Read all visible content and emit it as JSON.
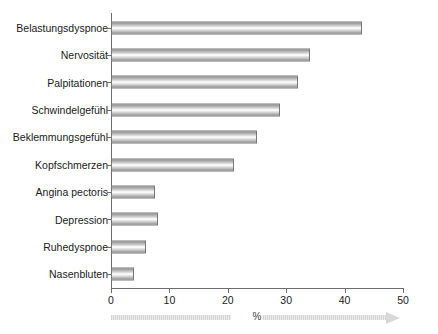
{
  "chart_data": {
    "type": "bar",
    "orientation": "horizontal",
    "title": "",
    "xlabel": "%",
    "ylabel": "",
    "xlim": [
      0,
      50
    ],
    "xticks": [
      "0",
      "10",
      "20",
      "30",
      "40",
      "50"
    ],
    "grid": false,
    "legend": null,
    "categories": [
      "Belastungsdyspnoe",
      "Nervosität",
      "Palpitationen",
      "Schwindelgefühl",
      "Beklemmungsgefühl",
      "Kopfschmerzen",
      "Angina pectoris",
      "Depression",
      "Ruhedyspnoe",
      "Nasenbluten"
    ],
    "values": [
      43,
      34,
      32,
      29,
      25,
      21,
      7.5,
      8,
      6,
      4
    ],
    "bar_color": "#c9c9c9",
    "bar_border_color": "#777777",
    "axis_color": "#6d6d6d",
    "text_color": "#1a1a1a"
  },
  "axis": {
    "x_arrow_label": "%"
  }
}
